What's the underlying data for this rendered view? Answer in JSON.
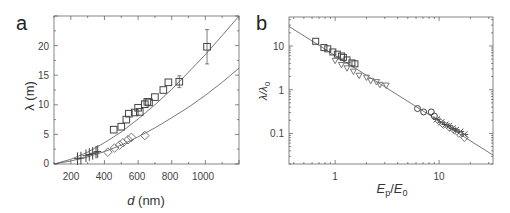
{
  "figure": {
    "panels": [
      "a",
      "b"
    ]
  },
  "chart_data": [
    {
      "panel": "a",
      "type": "scatter",
      "title": "",
      "xlabel": "d (nm)",
      "ylabel": "λ (m)",
      "xlim": [
        100,
        1200
      ],
      "ylim": [
        0,
        25
      ],
      "xticks": [
        200,
        400,
        600,
        800,
        1000
      ],
      "yticks": [
        0,
        5,
        10,
        15,
        20
      ],
      "grid": false,
      "legend": null,
      "series": [
        {
          "name": "squares",
          "marker": "square",
          "x": [
            455,
            500,
            530,
            545,
            580,
            600,
            610,
            640,
            655,
            665,
            700,
            750,
            780,
            845,
            1010
          ],
          "y": [
            5.8,
            6.3,
            7.5,
            8.5,
            8.7,
            9.5,
            8.8,
            10.1,
            10.5,
            10.4,
            11.3,
            12.5,
            13.8,
            13.9,
            19.8
          ],
          "error_y": {
            "845": 1.0,
            "1010": 2.9
          }
        },
        {
          "name": "diamonds",
          "marker": "diamond",
          "x": [
            420,
            460,
            490,
            510,
            540,
            560,
            640
          ],
          "y": [
            2.0,
            2.7,
            3.2,
            3.6,
            4.1,
            4.5,
            4.8
          ]
        },
        {
          "name": "crosses",
          "marker": "plus",
          "x": [
            240,
            260,
            290,
            310,
            330,
            350,
            360
          ],
          "y": [
            0.9,
            1.0,
            1.4,
            1.6,
            1.8,
            2.0,
            2.1
          ]
        },
        {
          "name": "fit-upper",
          "marker": "line",
          "x": [
            100,
            200,
            300,
            400,
            500,
            600,
            700,
            800,
            900,
            1000,
            1100,
            1200
          ],
          "y": [
            0,
            0.8,
            2.0,
            3.6,
            5.4,
            7.6,
            10.0,
            12.6,
            15.5,
            18.5,
            21.7,
            25.1
          ]
        },
        {
          "name": "fit-lower",
          "marker": "line",
          "x": [
            100,
            200,
            300,
            400,
            500,
            600,
            700,
            800,
            900,
            1000,
            1100,
            1200
          ],
          "y": [
            0,
            0.5,
            1.2,
            2.1,
            3.2,
            4.6,
            6.1,
            7.8,
            9.6,
            11.6,
            13.8,
            16.2
          ]
        }
      ]
    },
    {
      "panel": "b",
      "type": "scatter",
      "title": "",
      "xlabel": "Ep/E0",
      "ylabel": "λ/λ0",
      "xscale": "log",
      "yscale": "log",
      "xlim": [
        0.36,
        33
      ],
      "ylim": [
        0.02,
        46
      ],
      "xticks": [
        1,
        10
      ],
      "yticks": [
        0.1,
        1,
        10
      ],
      "grid": false,
      "legend": null,
      "series": [
        {
          "name": "squares",
          "marker": "square",
          "x": [
            0.65,
            0.78,
            0.85,
            0.95,
            1.05,
            1.15,
            1.2,
            1.3,
            1.45,
            1.55
          ],
          "y": [
            12.8,
            9.2,
            8.6,
            7.3,
            6.5,
            5.9,
            5.5,
            4.8,
            4.1,
            3.9
          ]
        },
        {
          "name": "triangles",
          "marker": "triangle-down",
          "x": [
            1.0,
            1.15,
            1.3,
            1.5,
            1.7,
            2.0,
            2.2,
            2.5,
            2.7,
            3.1
          ],
          "y": [
            4.6,
            3.7,
            3.1,
            2.6,
            2.1,
            1.9,
            1.6,
            1.5,
            1.3,
            1.25
          ]
        },
        {
          "name": "circles",
          "marker": "circle",
          "x": [
            6.2,
            7.1,
            8.4,
            9.0
          ],
          "y": [
            0.37,
            0.31,
            0.31,
            0.25
          ]
        },
        {
          "name": "crosses",
          "marker": "x",
          "x": [
            9.5,
            10.5,
            11.5,
            12.5,
            13.5,
            14.5,
            16.0,
            17.5
          ],
          "y": [
            0.21,
            0.18,
            0.16,
            0.15,
            0.13,
            0.12,
            0.11,
            0.095
          ]
        },
        {
          "name": "diamonds",
          "marker": "diamond",
          "x": [
            10.0,
            11.0,
            12.5,
            14.0,
            15.5,
            17.5
          ],
          "y": [
            0.19,
            0.16,
            0.14,
            0.12,
            0.1,
            0.08
          ]
        },
        {
          "name": "fit",
          "marker": "line",
          "x": [
            0.36,
            33
          ],
          "y": [
            28,
            0.032
          ]
        }
      ]
    }
  ],
  "labels": {
    "panel_a": "a",
    "panel_b": "b",
    "a_xlabel_var": "d",
    "a_xlabel_unit": " (nm)",
    "a_ylabel": "λ (m)",
    "b_xlabel_E": "E",
    "b_xlabel_p": "p",
    "b_xlabel_slash": "/",
    "b_xlabel_E0": "E",
    "b_xlabel_0": "0",
    "b_ylabel_l": "λ/λ",
    "b_ylabel_0": "0",
    "a_xticks": [
      "200",
      "400",
      "600",
      "800",
      "1000"
    ],
    "a_yticks": [
      "0",
      "5",
      "10",
      "15",
      "20"
    ],
    "b_xticks": [
      "1",
      "10"
    ],
    "b_yticks": [
      "10",
      "1",
      "0.1"
    ]
  },
  "colors": {
    "axis": "#555555",
    "marker": "#444444",
    "marker_light": "#777777",
    "fit_line": "#555555"
  }
}
